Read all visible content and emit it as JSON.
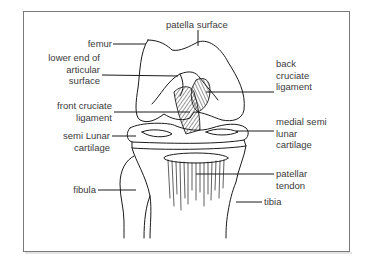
{
  "diagram": {
    "stroke_color": "#1a1a1a",
    "label_color": "#3a3a3a",
    "frame_color": "#7a7a7a",
    "labels": {
      "patella_surface": "patella surface",
      "femur": "femur",
      "lower_end_articular": [
        "lower end of",
        "articular",
        "surface"
      ],
      "front_cruciate": [
        "front cruciate",
        "ligament"
      ],
      "back_cruciate": [
        "back",
        "cruciate",
        "ligament"
      ],
      "medial_semi_lunar": [
        "medial semi",
        "lunar",
        "cartilage"
      ],
      "semi_lunar": [
        "semi Lunar",
        "cartilage"
      ],
      "fibula": "fibula",
      "patellar_tendon": [
        "patellar",
        "tendon"
      ],
      "tibia": "tibia"
    }
  }
}
